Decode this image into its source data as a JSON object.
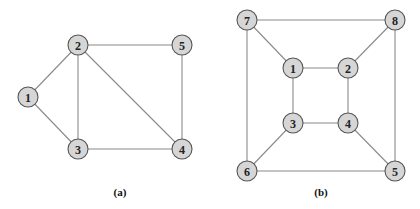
{
  "graphs": [
    {
      "id": "a",
      "caption": "(a)",
      "caption_pos": [
        120,
        196
      ],
      "nodes": [
        {
          "label": "1",
          "x": 28,
          "y": 97
        },
        {
          "label": "2",
          "x": 78,
          "y": 45
        },
        {
          "label": "5",
          "x": 182,
          "y": 45
        },
        {
          "label": "3",
          "x": 78,
          "y": 149
        },
        {
          "label": "4",
          "x": 182,
          "y": 149
        }
      ],
      "edges": [
        [
          "1",
          "2"
        ],
        [
          "1",
          "3"
        ],
        [
          "2",
          "3"
        ],
        [
          "2",
          "5"
        ],
        [
          "2",
          "4"
        ],
        [
          "3",
          "4"
        ],
        [
          "5",
          "4"
        ]
      ]
    },
    {
      "id": "b",
      "caption": "(b)",
      "caption_pos": [
        321,
        196
      ],
      "nodes": [
        {
          "label": "7",
          "x": 247,
          "y": 20
        },
        {
          "label": "8",
          "x": 395,
          "y": 20
        },
        {
          "label": "1",
          "x": 293,
          "y": 68
        },
        {
          "label": "2",
          "x": 348,
          "y": 68
        },
        {
          "label": "3",
          "x": 293,
          "y": 123
        },
        {
          "label": "4",
          "x": 348,
          "y": 123
        },
        {
          "label": "6",
          "x": 247,
          "y": 171
        },
        {
          "label": "5",
          "x": 395,
          "y": 171
        }
      ],
      "edges": [
        [
          "7",
          "8"
        ],
        [
          "7",
          "1"
        ],
        [
          "7",
          "6"
        ],
        [
          "8",
          "2"
        ],
        [
          "8",
          "5"
        ],
        [
          "1",
          "2"
        ],
        [
          "1",
          "3"
        ],
        [
          "2",
          "4"
        ],
        [
          "3",
          "4"
        ],
        [
          "3",
          "6"
        ],
        [
          "4",
          "5"
        ],
        [
          "6",
          "5"
        ]
      ]
    }
  ],
  "style": {
    "node_fill": "#d6d6d6",
    "node_stroke": "#555555",
    "edge_color": "#8a8a8a",
    "node_radius": 10
  }
}
